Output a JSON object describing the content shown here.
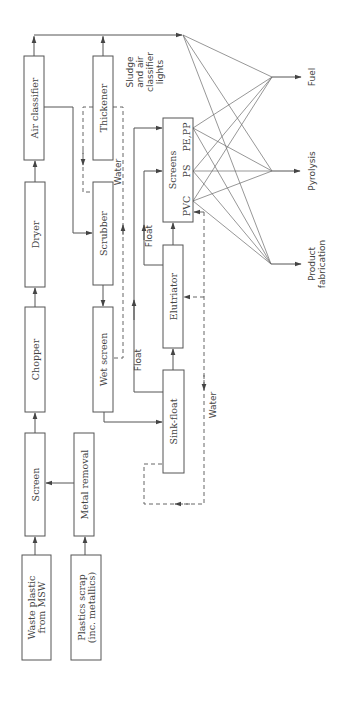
{
  "diagram": {
    "colors": {
      "stroke": "#555555",
      "text": "#444444",
      "background": "#ffffff"
    },
    "boxes": [
      {
        "id": "air-classifier",
        "label": [
          "Air classifier"
        ],
        "x": 24,
        "y": 56,
        "w": 20,
        "h": 104
      },
      {
        "id": "dryer",
        "label": [
          "Dryer"
        ],
        "x": 25,
        "y": 182,
        "w": 20,
        "h": 105
      },
      {
        "id": "chopper",
        "label": [
          "Chopper"
        ],
        "x": 25,
        "y": 307,
        "w": 20,
        "h": 105
      },
      {
        "id": "screen",
        "label": [
          "Screen"
        ],
        "x": 25,
        "y": 433,
        "w": 20,
        "h": 103
      },
      {
        "id": "waste-plastic",
        "label": [
          "Waste plastic",
          "from MSW"
        ],
        "x": 22,
        "y": 555,
        "w": 29,
        "h": 105
      },
      {
        "id": "metal-removal",
        "label": [
          "Metal removal"
        ],
        "x": 74,
        "y": 433,
        "w": 20,
        "h": 103
      },
      {
        "id": "plastics-scrap",
        "label": [
          "Plastics scrap",
          "(inc. metallics)"
        ],
        "x": 71,
        "y": 555,
        "w": 30,
        "h": 105
      },
      {
        "id": "thickener",
        "label": [
          "Thickener"
        ],
        "x": 93,
        "y": 56,
        "w": 20,
        "h": 104
      },
      {
        "id": "scrubber",
        "label": [
          "Scrubber"
        ],
        "x": 93,
        "y": 182,
        "w": 20,
        "h": 103
      },
      {
        "id": "wet-screen",
        "label": [
          "Wet screen"
        ],
        "x": 93,
        "y": 307,
        "w": 20,
        "h": 105
      },
      {
        "id": "screens",
        "label": [
          "Screens"
        ],
        "x": 163,
        "y": 118,
        "w": 30,
        "h": 104
      },
      {
        "id": "elutriator",
        "label": [
          "Elutriator"
        ],
        "x": 163,
        "y": 245,
        "w": 20,
        "h": 103
      },
      {
        "id": "sink-float",
        "label": [
          "Sink-float"
        ],
        "x": 163,
        "y": 370,
        "w": 21,
        "h": 103
      }
    ],
    "screen_fractions": [
      {
        "label": "PE,PP",
        "y": 128
      },
      {
        "label": "PS",
        "y": 171
      },
      {
        "label": "PVC",
        "y": 201
      }
    ],
    "flow_labels": [
      {
        "id": "float-1",
        "text": "Float",
        "x": 141,
        "y": 360
      },
      {
        "id": "float-2",
        "text": "Float",
        "x": 152,
        "y": 236
      },
      {
        "id": "water-1",
        "text": "Water",
        "x": 121,
        "y": 172
      },
      {
        "id": "water-2",
        "text": "Water",
        "x": 216,
        "y": 405
      }
    ],
    "sludge_label": [
      "Sludge",
      "and air",
      "classifier",
      "lights"
    ],
    "outputs": [
      {
        "id": "fuel",
        "label": [
          "Fuel"
        ],
        "node_x": 272,
        "node_y": 77
      },
      {
        "id": "pyrolysis",
        "label": [
          "Pyrolysis"
        ],
        "node_x": 272,
        "node_y": 171
      },
      {
        "id": "product-fabrication",
        "label": [
          "Product",
          "fabrication"
        ],
        "node_x": 271,
        "node_y": 264
      }
    ],
    "sludge_node": {
      "x": 183,
      "y": 35
    }
  }
}
